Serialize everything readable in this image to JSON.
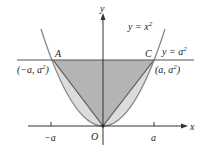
{
  "diagram": {
    "curve_label": "y = x",
    "curve_label_exp": "2",
    "line_label": "y = a",
    "line_label_exp": "2",
    "axis_x_label": "x",
    "axis_y_label": "y",
    "origin_label": "O",
    "point_A_label": "A",
    "point_C_label": "C",
    "point_A_coords": "(−a, a",
    "point_A_coords_end": ")",
    "point_C_coords": "(a, a",
    "point_C_coords_end": ")",
    "exp2": "2",
    "tick_neg_label": "−a",
    "tick_pos_label": "a",
    "colors": {
      "triangle_fill": "#b4b4b4",
      "parabola_region_fill": "#dcdcdc",
      "curve_stroke": "#888888",
      "line_stroke": "#555555",
      "axis_stroke": "#333333"
    }
  }
}
